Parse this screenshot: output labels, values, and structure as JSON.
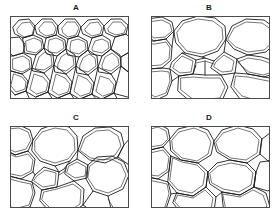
{
  "figure": {
    "type": "micrograph-panel-grid",
    "background_color": "#ffffff",
    "line_color": "#1c1c1c",
    "frame_color": "#4a4a4a",
    "columns": 2,
    "rows": 2,
    "panels": [
      {
        "id": "A",
        "label": "A",
        "label_x": 66,
        "label_y": 3,
        "frame": {
          "x": 10,
          "y": 16,
          "w": 119,
          "h": 83
        },
        "description": "Fine-celled foam: many small tightly packed polygonal cells",
        "cell_size": "small",
        "approx_cell_count": 40
      },
      {
        "id": "B",
        "label": "B",
        "label_x": 199,
        "label_y": 3,
        "frame": {
          "x": 151,
          "y": 16,
          "w": 119,
          "h": 83
        },
        "description": "Coarse-celled foam: few very large cells with small diamond cells at junctions",
        "cell_size": "large",
        "approx_cell_count": 10
      },
      {
        "id": "C",
        "label": "C",
        "label_x": 66,
        "label_y": 113,
        "frame": {
          "x": 10,
          "y": 126,
          "w": 119,
          "h": 82
        },
        "description": "Mixed foam: large rounded cells with intermediate and small square cells",
        "cell_size": "mixed",
        "approx_cell_count": 16
      },
      {
        "id": "D",
        "label": "D",
        "label_x": 199,
        "label_y": 113,
        "frame": {
          "x": 151,
          "y": 126,
          "w": 119,
          "h": 82
        },
        "description": "Coarse foam: uniform large rounded polygonal cells",
        "cell_size": "large",
        "approx_cell_count": 9
      }
    ]
  }
}
